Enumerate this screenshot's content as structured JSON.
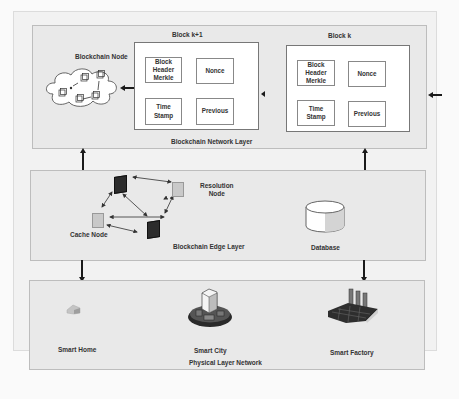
{
  "network_layer": {
    "title": "Blockchain Network Layer",
    "node_label": "Blockchain Node",
    "blocks": [
      {
        "title": "Block k+1",
        "cells": {
          "header": [
            "Block",
            "Header",
            "Merkle"
          ],
          "nonce": "Nonce",
          "timestamp": [
            "Time",
            "Stamp"
          ],
          "previous": "Previous"
        }
      },
      {
        "title": "Block k",
        "cells": {
          "header": [
            "Block",
            "Header",
            "Merkle"
          ],
          "nonce": "Nonce",
          "timestamp": [
            "Time",
            "Stamp"
          ],
          "previous": "Previous"
        }
      }
    ]
  },
  "edge_layer": {
    "title": "Blockchain Edge Layer",
    "resolution_node": [
      "Resolution",
      "Node"
    ],
    "cache_node": "Cache Node",
    "database": "Database"
  },
  "physical_layer": {
    "title": "Physical Layer Network",
    "items": [
      "Smart Home",
      "Smart City",
      "Smart Factory"
    ]
  },
  "colors": {
    "layer_bg": "#e9e9e9",
    "block_bg": "#ffffff",
    "arrow": "#1a1a1a"
  }
}
